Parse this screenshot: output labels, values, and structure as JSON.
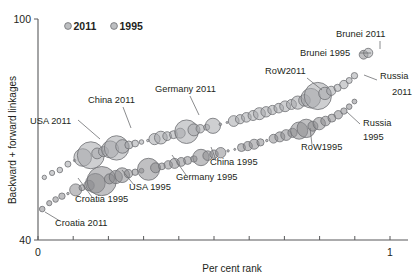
{
  "chart_data": {
    "type": "scatter",
    "title": "",
    "xlabel": "Per cent rank",
    "ylabel": "Backward + forward linkages",
    "xlim": [
      0,
      1
    ],
    "ylim": [
      40,
      100
    ],
    "xticks": [
      0,
      1
    ],
    "xticklabels": [
      "0",
      "1"
    ],
    "yticks": [
      40,
      100
    ],
    "yticklabels": [
      "40",
      "100"
    ],
    "grid": false,
    "legend": {
      "position": "top-left-inside",
      "entries": [
        {
          "label": "2011",
          "color": "#a7a9ac"
        },
        {
          "label": "1995",
          "color": "#a7a9ac"
        }
      ]
    },
    "bubble_note": "Marker area encodes economy size; both series drawn in translucent grey",
    "series": [
      {
        "name": "2011",
        "color": "#a6a8ab",
        "points": [
          {
            "x": 0.018,
            "y": 57.0,
            "r": 2.2
          },
          {
            "x": 0.04,
            "y": 58.2,
            "r": 2.6
          },
          {
            "x": 0.062,
            "y": 59.0,
            "r": 2.8
          },
          {
            "x": 0.085,
            "y": 60.6,
            "r": 3.0
          },
          {
            "x": 0.104,
            "y": 61.6,
            "r": 1.2
          },
          {
            "x": 0.127,
            "y": 62.4,
            "r": 8.8
          },
          {
            "x": 0.15,
            "y": 63.0,
            "r": 13.5
          },
          {
            "x": 0.168,
            "y": 63.5,
            "r": 5.4
          },
          {
            "x": 0.186,
            "y": 64.0,
            "r": 5.0
          },
          {
            "x": 0.205,
            "y": 64.6,
            "r": 8.5
          },
          {
            "x": 0.223,
            "y": 65.0,
            "r": 12.2
          },
          {
            "x": 0.24,
            "y": 65.4,
            "r": 6.8
          },
          {
            "x": 0.258,
            "y": 65.8,
            "r": 4.0
          },
          {
            "x": 0.276,
            "y": 66.2,
            "r": 3.4
          },
          {
            "x": 0.294,
            "y": 66.6,
            "r": 2.3
          },
          {
            "x": 0.312,
            "y": 67.0,
            "r": 1.2
          },
          {
            "x": 0.331,
            "y": 67.4,
            "r": 5.6
          },
          {
            "x": 0.349,
            "y": 67.8,
            "r": 6.4
          },
          {
            "x": 0.367,
            "y": 68.2,
            "r": 4.4
          },
          {
            "x": 0.385,
            "y": 68.6,
            "r": 4.0
          },
          {
            "x": 0.404,
            "y": 69.0,
            "r": 5.0
          },
          {
            "x": 0.422,
            "y": 69.4,
            "r": 11.8
          },
          {
            "x": 0.443,
            "y": 69.9,
            "r": 6.0
          },
          {
            "x": 0.461,
            "y": 70.2,
            "r": 4.2
          },
          {
            "x": 0.479,
            "y": 70.6,
            "r": 3.0
          },
          {
            "x": 0.497,
            "y": 71.0,
            "r": 7.6
          },
          {
            "x": 0.518,
            "y": 71.4,
            "r": 1.3
          },
          {
            "x": 0.537,
            "y": 71.9,
            "r": 1.0
          },
          {
            "x": 0.556,
            "y": 72.3,
            "r": 5.4
          },
          {
            "x": 0.574,
            "y": 72.8,
            "r": 4.6
          },
          {
            "x": 0.592,
            "y": 73.3,
            "r": 4.8
          },
          {
            "x": 0.611,
            "y": 73.8,
            "r": 5.0
          },
          {
            "x": 0.629,
            "y": 74.3,
            "r": 6.0
          },
          {
            "x": 0.648,
            "y": 74.8,
            "r": 5.2
          },
          {
            "x": 0.666,
            "y": 75.3,
            "r": 4.6
          },
          {
            "x": 0.684,
            "y": 75.8,
            "r": 4.8
          },
          {
            "x": 0.702,
            "y": 76.3,
            "r": 5.4
          },
          {
            "x": 0.72,
            "y": 76.8,
            "r": 5.0
          },
          {
            "x": 0.738,
            "y": 77.3,
            "r": 6.6
          },
          {
            "x": 0.757,
            "y": 77.9,
            "r": 5.8
          },
          {
            "x": 0.775,
            "y": 78.5,
            "r": 9.8
          },
          {
            "x": 0.795,
            "y": 79.1,
            "r": 13.6
          },
          {
            "x": 0.815,
            "y": 79.8,
            "r": 6.2
          },
          {
            "x": 0.833,
            "y": 80.5,
            "r": 4.6
          },
          {
            "x": 0.851,
            "y": 81.3,
            "r": 3.6
          },
          {
            "x": 0.869,
            "y": 82.2,
            "r": 4.2
          },
          {
            "x": 0.884,
            "y": 83.3,
            "r": 3.0
          },
          {
            "x": 0.899,
            "y": 84.6,
            "r": 3.2
          },
          {
            "x": 0.938,
            "y": 90.8,
            "r": 4.6
          }
        ]
      },
      {
        "name": "1995",
        "color": "#8c8d90",
        "points": [
          {
            "x": 0.012,
            "y": 48.4,
            "r": 2.8
          },
          {
            "x": 0.032,
            "y": 50.0,
            "r": 2.6
          },
          {
            "x": 0.05,
            "y": 51.0,
            "r": 2.8
          },
          {
            "x": 0.068,
            "y": 51.9,
            "r": 3.2
          },
          {
            "x": 0.085,
            "y": 52.6,
            "r": 1.2
          },
          {
            "x": 0.107,
            "y": 53.6,
            "r": 6.0
          },
          {
            "x": 0.125,
            "y": 54.2,
            "r": 3.0
          },
          {
            "x": 0.145,
            "y": 54.8,
            "r": 5.2
          },
          {
            "x": 0.163,
            "y": 55.4,
            "r": 9.8
          },
          {
            "x": 0.181,
            "y": 56.0,
            "r": 14.6
          },
          {
            "x": 0.203,
            "y": 56.6,
            "r": 5.0
          },
          {
            "x": 0.221,
            "y": 57.1,
            "r": 6.6
          },
          {
            "x": 0.239,
            "y": 57.6,
            "r": 7.4
          },
          {
            "x": 0.257,
            "y": 58.0,
            "r": 4.2
          },
          {
            "x": 0.276,
            "y": 58.4,
            "r": 3.2
          },
          {
            "x": 0.294,
            "y": 58.8,
            "r": 2.4
          },
          {
            "x": 0.314,
            "y": 59.2,
            "r": 11.0
          },
          {
            "x": 0.334,
            "y": 59.6,
            "r": 5.0
          },
          {
            "x": 0.352,
            "y": 60.0,
            "r": 3.4
          },
          {
            "x": 0.37,
            "y": 60.4,
            "r": 4.2
          },
          {
            "x": 0.388,
            "y": 60.8,
            "r": 5.0
          },
          {
            "x": 0.407,
            "y": 61.2,
            "r": 4.4
          },
          {
            "x": 0.425,
            "y": 61.6,
            "r": 4.0
          },
          {
            "x": 0.443,
            "y": 62.0,
            "r": 3.2
          },
          {
            "x": 0.463,
            "y": 62.4,
            "r": 8.2
          },
          {
            "x": 0.482,
            "y": 62.9,
            "r": 4.8
          },
          {
            "x": 0.5,
            "y": 63.3,
            "r": 4.2
          },
          {
            "x": 0.519,
            "y": 63.7,
            "r": 5.2
          },
          {
            "x": 0.54,
            "y": 64.2,
            "r": 1.2
          },
          {
            "x": 0.559,
            "y": 64.6,
            "r": 1.0
          },
          {
            "x": 0.578,
            "y": 65.1,
            "r": 4.0
          },
          {
            "x": 0.596,
            "y": 65.5,
            "r": 4.6
          },
          {
            "x": 0.614,
            "y": 66.0,
            "r": 5.0
          },
          {
            "x": 0.632,
            "y": 66.5,
            "r": 3.6
          },
          {
            "x": 0.65,
            "y": 67.0,
            "r": 1.2
          },
          {
            "x": 0.669,
            "y": 67.5,
            "r": 4.4
          },
          {
            "x": 0.687,
            "y": 68.0,
            "r": 5.0
          },
          {
            "x": 0.705,
            "y": 68.5,
            "r": 5.4
          },
          {
            "x": 0.723,
            "y": 69.1,
            "r": 4.6
          },
          {
            "x": 0.742,
            "y": 69.7,
            "r": 8.6
          },
          {
            "x": 0.762,
            "y": 70.3,
            "r": 9.2
          },
          {
            "x": 0.781,
            "y": 70.9,
            "r": 5.0
          },
          {
            "x": 0.799,
            "y": 71.6,
            "r": 6.2
          },
          {
            "x": 0.817,
            "y": 72.3,
            "r": 4.8
          },
          {
            "x": 0.835,
            "y": 73.1,
            "r": 4.0
          },
          {
            "x": 0.853,
            "y": 74.0,
            "r": 4.2
          },
          {
            "x": 0.869,
            "y": 75.0,
            "r": 3.2
          },
          {
            "x": 0.884,
            "y": 76.2,
            "r": 2.8
          },
          {
            "x": 0.899,
            "y": 77.6,
            "r": 2.4
          },
          {
            "x": 0.925,
            "y": 90.3,
            "r": 4.4
          }
        ]
      }
    ],
    "annotations": [
      {
        "id": "usa-2011",
        "text": "USA 2011",
        "tx": 30,
        "ty": 124,
        "anchor": "start",
        "lx": 78,
        "ly": 120,
        "px": 100,
        "py": 139
      },
      {
        "id": "china-2011",
        "text": "China 2011",
        "tx": 88,
        "ty": 103,
        "anchor": "start",
        "lx": 123,
        "ly": 107,
        "px": 131,
        "py": 128
      },
      {
        "id": "germany-2011",
        "text": "Germany 2011",
        "tx": 155,
        "ty": 92,
        "anchor": "start",
        "lx": 190,
        "ly": 96,
        "px": 199,
        "py": 115
      },
      {
        "id": "row-2011",
        "text": "RoW2011",
        "tx": 265,
        "ty": 74,
        "anchor": "start",
        "lx": 307,
        "ly": 78,
        "px": 322,
        "py": 90
      },
      {
        "id": "brunei-2011",
        "text": "Brunei 2011",
        "tx": 336,
        "ty": 37,
        "anchor": "start",
        "lx": 380,
        "ly": 41,
        "px": 380,
        "py": 49
      },
      {
        "id": "brunei-1995",
        "text": "Brunei 1995",
        "tx": 300,
        "ty": 56,
        "anchor": "start",
        "lx": 360,
        "ly": 53,
        "px": 371,
        "py": 53
      },
      {
        "id": "russia-2011",
        "text": "Russia",
        "tx": 380,
        "ty": 79,
        "anchor": "start",
        "lx": 377,
        "ly": 80,
        "px": 364,
        "py": 75
      },
      {
        "id": "russia-2011-y",
        "text": "2011",
        "tx": 392,
        "ty": 95,
        "anchor": "start",
        "lx": 0,
        "ly": 0,
        "px": 0,
        "py": 0
      },
      {
        "id": "russia-1995",
        "text": "Russia",
        "tx": 363,
        "ty": 126,
        "anchor": "start",
        "lx": 360,
        "ly": 124,
        "px": 347,
        "py": 112
      },
      {
        "id": "russia-1995-y",
        "text": "1995",
        "tx": 363,
        "ty": 140,
        "anchor": "start",
        "lx": 0,
        "ly": 0,
        "px": 0,
        "py": 0
      },
      {
        "id": "row-1995",
        "text": "RoW1995",
        "tx": 301,
        "ty": 150,
        "anchor": "start",
        "lx": 312,
        "ly": 145,
        "px": 310,
        "py": 128
      },
      {
        "id": "china-1995",
        "text": "China 1995",
        "tx": 210,
        "ty": 165,
        "anchor": "start",
        "lx": 216,
        "ly": 160,
        "px": 211,
        "py": 147
      },
      {
        "id": "germany-1995",
        "text": "Germany 1995",
        "tx": 176,
        "ty": 180,
        "anchor": "start",
        "lx": 186,
        "ly": 175,
        "px": 172,
        "py": 155
      },
      {
        "id": "usa-1995",
        "text": "USA 1995",
        "tx": 129,
        "ty": 190,
        "anchor": "start",
        "lx": 134,
        "ly": 185,
        "px": 122,
        "py": 170
      },
      {
        "id": "croatia-1995",
        "text": "Croatia 1995",
        "tx": 75,
        "ty": 202,
        "anchor": "start",
        "lx": 92,
        "ly": 197,
        "px": 78,
        "py": 178
      },
      {
        "id": "croatia-2011",
        "text": "Croatia 2011",
        "tx": 55,
        "ty": 226,
        "anchor": "start",
        "lx": 60,
        "ly": 221,
        "px": 45,
        "py": 212
      }
    ]
  }
}
